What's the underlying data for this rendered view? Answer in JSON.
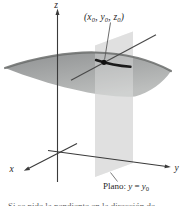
{
  "figure": {
    "background": "#ffffff",
    "colors": {
      "surface_top": "#8f9192",
      "surface_bottom": "#bdbfbe",
      "surface_edge": "#6a6c6b",
      "plane_fill": "#d4d5d4",
      "plane_overlay": "rgba(255,255,255,0.28)",
      "axis_color": "#3a3a3a",
      "tangent_color": "#4a4a4a",
      "leader_color": "#5a5a5a",
      "curve_color": "#1a1a1a",
      "dot_color": "#111111",
      "caption_color": "#6b6b6b"
    },
    "labels": {
      "z_axis": "z",
      "x_axis": "x",
      "y_axis": "y",
      "point": {
        "p1": "(x",
        "s1": "0",
        "p2": ", y",
        "s2": "0",
        "p3": ", z",
        "s3": "0",
        "p4": ")"
      },
      "plane": {
        "prefix": "Plano: ",
        "lhs": "y",
        "equals": " = ",
        "rhs": "y",
        "rhs_sub": "0"
      }
    },
    "caption_fragment": "Si se pide la pendiente en la dirección de"
  }
}
